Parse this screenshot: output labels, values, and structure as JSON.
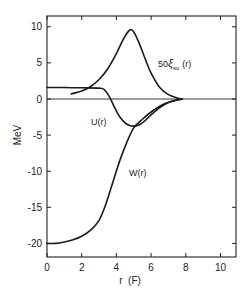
{
  "chart_data": {
    "type": "line",
    "title": "",
    "xlabel": "r (F)",
    "ylabel": "MeV",
    "xlim": [
      0,
      10.9
    ],
    "ylim": [
      -21.8,
      11.5
    ],
    "grid": false,
    "legend_position": "inline labels",
    "x_ticks": [
      0,
      2,
      4,
      6,
      8,
      10
    ],
    "x_tick_labels": [
      "0",
      "2",
      "4",
      "6",
      "8",
      "10"
    ],
    "y_ticks": [
      10,
      5,
      0,
      -5,
      -10,
      -15,
      -20
    ],
    "y_tick_labels": [
      "10",
      "5",
      "0",
      "-5",
      "-10",
      "-15",
      "-20"
    ],
    "zero_line": true,
    "series": [
      {
        "name": "50ξso(r)",
        "label_main": "50",
        "label_symbol": "ξ",
        "label_sub": "so",
        "label_tail": "(r)",
        "x": [
          1.4,
          2.0,
          2.5,
          3.0,
          3.5,
          4.0,
          4.4,
          4.7,
          4.85,
          5.0,
          5.3,
          5.7,
          6.0,
          6.5,
          7.0,
          7.5,
          7.8
        ],
        "y": [
          0.7,
          1.1,
          1.7,
          2.7,
          4.2,
          6.3,
          8.3,
          9.4,
          9.6,
          9.3,
          7.8,
          5.3,
          3.6,
          1.6,
          0.6,
          0.15,
          0.0
        ]
      },
      {
        "name": "U(r)",
        "x": [
          0,
          1.0,
          2.0,
          3.0,
          3.3,
          3.6,
          3.9,
          4.2,
          4.5,
          4.8,
          5.0,
          5.3,
          5.6,
          6.0,
          6.5,
          7.0,
          7.5,
          7.8
        ],
        "y": [
          1.6,
          1.6,
          1.55,
          1.5,
          1.3,
          0.3,
          -1.2,
          -2.5,
          -3.3,
          -3.7,
          -3.75,
          -3.6,
          -3.1,
          -2.2,
          -1.2,
          -0.5,
          -0.15,
          0.0
        ]
      },
      {
        "name": "W(r)",
        "x": [
          0,
          0.5,
          1.0,
          1.5,
          2.0,
          2.5,
          3.0,
          3.4,
          3.8,
          4.2,
          4.6,
          5.0,
          5.5,
          6.0,
          6.5,
          7.0,
          7.5,
          7.8
        ],
        "y": [
          -20.0,
          -20.0,
          -19.8,
          -19.5,
          -19.0,
          -18.2,
          -16.8,
          -14.5,
          -11.5,
          -8.5,
          -6.0,
          -4.0,
          -2.8,
          -1.8,
          -1.0,
          -0.45,
          -0.12,
          0.0
        ]
      }
    ],
    "annotations": [
      {
        "text": "50ξso(r)",
        "x": 6.0,
        "y": 6.0
      },
      {
        "text": "U(r)",
        "x": 3.3,
        "y": -3.4
      },
      {
        "text": "W(r)",
        "x": 5.6,
        "y": -7.0
      }
    ]
  },
  "labels": {
    "xlabel": "r  (F)",
    "ylabel": "MeV",
    "xi_main": "50",
    "xi_symbol": "ξ",
    "xi_sub": "so",
    "xi_tail": "(r)",
    "u_label": "U(r)",
    "w_label": "W(r)"
  }
}
